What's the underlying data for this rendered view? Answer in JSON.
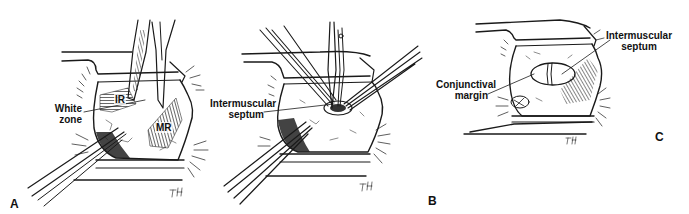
{
  "figure": {
    "panels": [
      {
        "id": "A",
        "letter": "A",
        "labels": {
          "white_zone_line1": "White",
          "white_zone_line2": "zone",
          "ir": "IR",
          "mr": "MR"
        },
        "signature": "TH"
      },
      {
        "id": "B",
        "letter": "B",
        "labels": {
          "septum_line1": "Intermuscular",
          "septum_line2": "septum"
        },
        "signature": "TH"
      },
      {
        "id": "C",
        "letter": "C",
        "labels": {
          "septum_line1": "Intermuscular",
          "septum_line2": "septum",
          "conj_line1": "Conjunctival",
          "conj_line2": "margin"
        },
        "signature": "TH"
      }
    ],
    "colors": {
      "ink": "#1a1a1a",
      "background": "#ffffff",
      "hatch": "#555555"
    }
  }
}
